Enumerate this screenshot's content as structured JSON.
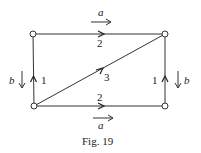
{
  "figure": {
    "caption": "Fig. 19",
    "line_color": "#333333",
    "node_fill": "#ffffff"
  },
  "nodes": [
    {
      "id": "top-left",
      "x": 33,
      "y": 34
    },
    {
      "id": "top-right",
      "x": 165,
      "y": 34
    },
    {
      "id": "bottom-left",
      "x": 34,
      "y": 106
    },
    {
      "id": "bottom-right",
      "x": 165,
      "y": 106
    }
  ],
  "edges": {
    "top": {
      "label": "2",
      "direction": "right"
    },
    "bottom": {
      "label": "2",
      "direction": "right"
    },
    "diagonal": {
      "label": "3",
      "direction": "up-right"
    },
    "left": {
      "label": "1",
      "direction": "up"
    },
    "right": {
      "label": "1",
      "direction": "up"
    }
  },
  "external_arrows": {
    "top": {
      "label": "a",
      "direction": "right"
    },
    "bottom": {
      "label": "a",
      "direction": "right"
    },
    "left": {
      "label": "b",
      "direction": "down"
    },
    "right": {
      "label": "b",
      "direction": "down"
    }
  }
}
